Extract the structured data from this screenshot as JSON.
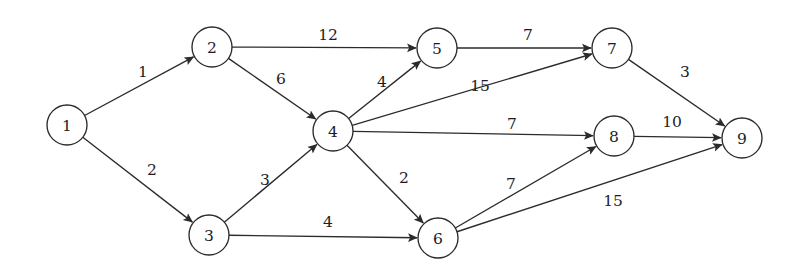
{
  "diagram": {
    "type": "directed-weighted-graph",
    "canvas": {
      "width": 804,
      "height": 273,
      "background": "#ffffff"
    },
    "style": {
      "node_radius": 20,
      "node_fill": "#ffffff",
      "stroke_color": "#2b2b2b",
      "label_color": "#1d1d1d"
    },
    "nodes": [
      {
        "id": "1",
        "label": "1",
        "x": 67,
        "y": 125
      },
      {
        "id": "2",
        "label": "2",
        "x": 212,
        "y": 47
      },
      {
        "id": "3",
        "label": "3",
        "x": 209,
        "y": 235
      },
      {
        "id": "4",
        "label": "4",
        "x": 333,
        "y": 131
      },
      {
        "id": "5",
        "label": "5",
        "x": 437,
        "y": 48
      },
      {
        "id": "6",
        "label": "6",
        "x": 438,
        "y": 238
      },
      {
        "id": "7",
        "label": "7",
        "x": 612,
        "y": 48
      },
      {
        "id": "8",
        "label": "8",
        "x": 614,
        "y": 136
      },
      {
        "id": "9",
        "label": "9",
        "x": 742,
        "y": 138
      }
    ],
    "edges": [
      {
        "from": "1",
        "to": "2",
        "weight": "1",
        "label_x": 143,
        "label_y": 72
      },
      {
        "from": "1",
        "to": "3",
        "weight": "2",
        "label_x": 152,
        "label_y": 170
      },
      {
        "from": "2",
        "to": "5",
        "weight": "12",
        "label_x": 328,
        "label_y": 35
      },
      {
        "from": "2",
        "to": "4",
        "weight": "6",
        "label_x": 281,
        "label_y": 79
      },
      {
        "from": "3",
        "to": "4",
        "weight": "3",
        "label_x": 265,
        "label_y": 180
      },
      {
        "from": "3",
        "to": "6",
        "weight": "4",
        "label_x": 328,
        "label_y": 222
      },
      {
        "from": "4",
        "to": "5",
        "weight": "4",
        "label_x": 382,
        "label_y": 82
      },
      {
        "from": "4",
        "to": "7",
        "weight": "15",
        "label_x": 480,
        "label_y": 86
      },
      {
        "from": "4",
        "to": "8",
        "weight": "7",
        "label_x": 512,
        "label_y": 124
      },
      {
        "from": "4",
        "to": "6",
        "weight": "2",
        "label_x": 404,
        "label_y": 178
      },
      {
        "from": "5",
        "to": "7",
        "weight": "7",
        "label_x": 528,
        "label_y": 35
      },
      {
        "from": "6",
        "to": "8",
        "weight": "7",
        "label_x": 511,
        "label_y": 184
      },
      {
        "from": "6",
        "to": "9",
        "weight": "15",
        "label_x": 613,
        "label_y": 201
      },
      {
        "from": "7",
        "to": "9",
        "weight": "3",
        "label_x": 685,
        "label_y": 72
      },
      {
        "from": "8",
        "to": "9",
        "weight": "10",
        "label_x": 672,
        "label_y": 122
      }
    ]
  }
}
